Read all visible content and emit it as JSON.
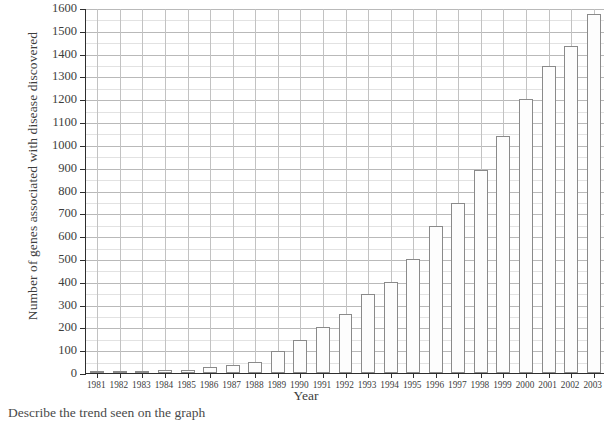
{
  "chart_data": {
    "type": "bar",
    "title": "",
    "xlabel": "Year",
    "ylabel": "Number of genes associated with disease discovered",
    "categories": [
      "1981",
      "1982",
      "1983",
      "1984",
      "1985",
      "1986",
      "1987",
      "1988",
      "1989",
      "1990",
      "1991",
      "1992",
      "1993",
      "1994",
      "1995",
      "1996",
      "1997",
      "1998",
      "1999",
      "2000",
      "2001",
      "2002",
      "2003"
    ],
    "values": [
      3,
      8,
      11,
      14,
      13,
      25,
      33,
      48,
      97,
      145,
      200,
      260,
      345,
      400,
      500,
      645,
      745,
      890,
      1040,
      1200,
      1345,
      1435,
      1575
    ],
    "ylim": [
      0,
      1600
    ],
    "ytick_step": 100,
    "ytick_labels": [
      "0",
      "100",
      "200",
      "300",
      "400",
      "500",
      "600",
      "700",
      "800",
      "900",
      "1000",
      "1100",
      "1200",
      "1300",
      "1400",
      "1500",
      "1600"
    ],
    "grid": "both",
    "legend": "none"
  },
  "caption": {
    "text": "Describe the trend seen on the graph"
  }
}
